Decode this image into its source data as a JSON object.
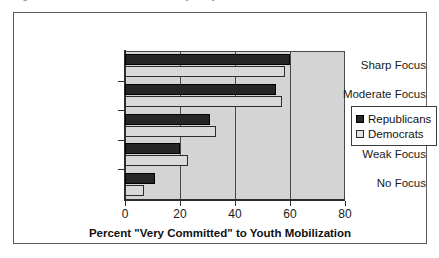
{
  "caption": {
    "text": "Figure 3.4   Youth Mobilization Efforts by Party"
  },
  "legend": {
    "position": "right",
    "entries": [
      {
        "label": "Republicans",
        "swatch": "dark-filled-square",
        "color": "#262626"
      },
      {
        "label": "Democrats",
        "swatch": "light-filled-square",
        "color": "#d9d9d9"
      }
    ]
  },
  "axis": {
    "x_title": "Percent \"Very Committed\" to Youth Mobilization",
    "x_ticks": [
      "0",
      "20",
      "40",
      "60",
      "80"
    ]
  },
  "chart_data": {
    "type": "bar",
    "orientation": "horizontal",
    "title": "",
    "xlabel": "Percent \"Very Committed\" to Youth Mobilization",
    "ylabel": "",
    "xlim": [
      0,
      80
    ],
    "xticks": [
      0,
      20,
      40,
      60,
      80
    ],
    "grid": true,
    "legend_position": "right",
    "categories": [
      "Sharp Focus",
      "Moderate Focus",
      "Modest Focus",
      "Weak Focus",
      "No Focus"
    ],
    "series": [
      {
        "name": "Republicans",
        "color": "#262626",
        "values": [
          60,
          55,
          31,
          20,
          11
        ]
      },
      {
        "name": "Democrats",
        "color": "#d9d9d9",
        "values": [
          58,
          57,
          33,
          23,
          7
        ]
      }
    ]
  }
}
